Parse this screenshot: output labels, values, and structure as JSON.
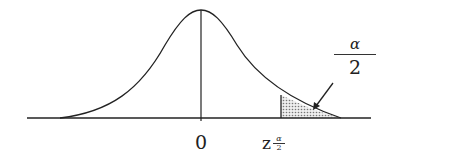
{
  "diagram": {
    "type": "normal-distribution-curve",
    "axis": {
      "center_label": "0",
      "critical_value_label": {
        "base": "z",
        "subscript_numerator": "α",
        "subscript_denominator": "2"
      }
    },
    "shaded_region": {
      "label_numerator": "α",
      "label_denominator": "2",
      "side": "right-tail"
    },
    "colors": {
      "line": "#222222",
      "shade": "#bbbbbb",
      "background": "#ffffff"
    }
  }
}
